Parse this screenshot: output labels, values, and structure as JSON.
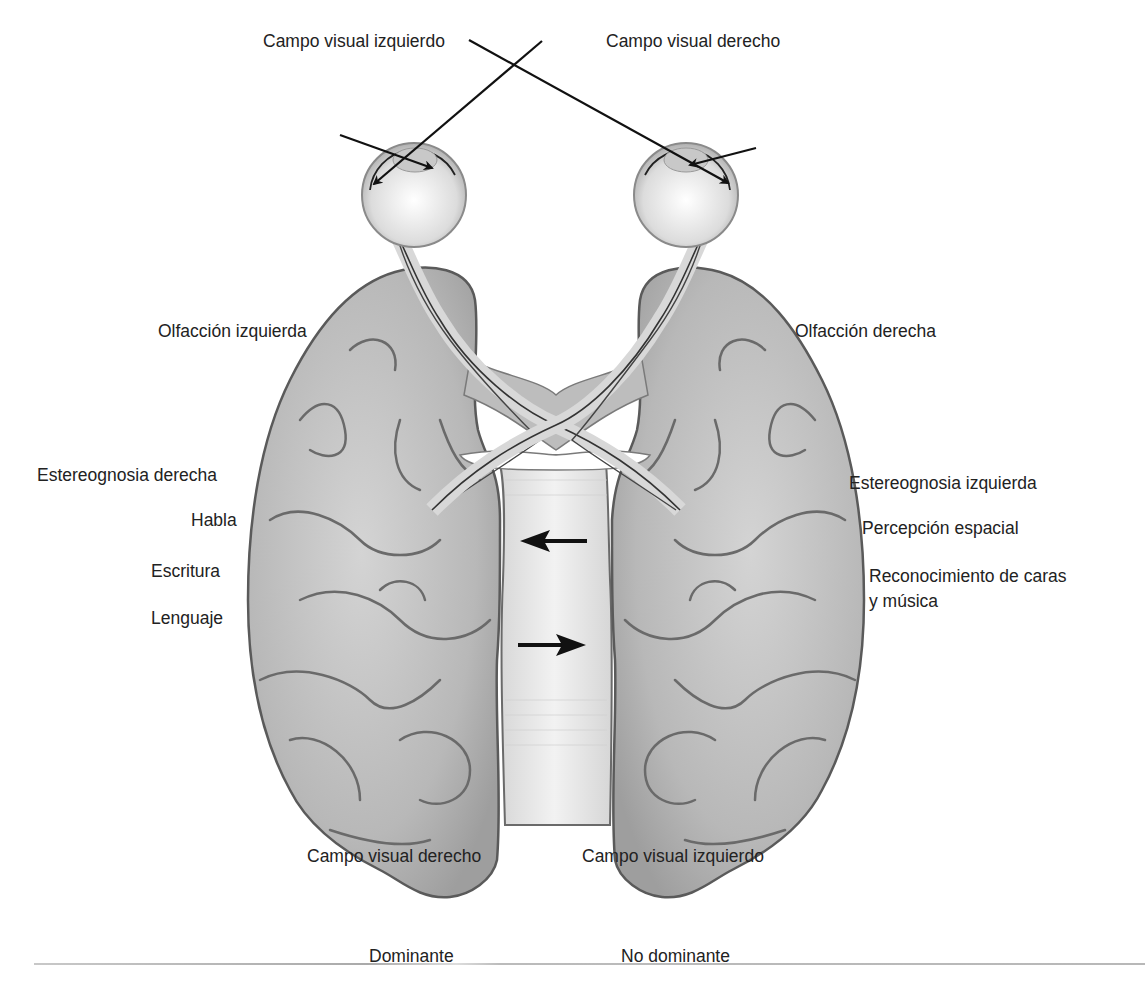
{
  "figure": {
    "colors": {
      "brain_fill": "#b9b9b9",
      "brain_outline": "#5a5a5a",
      "sulci": "#6a6a6a",
      "eye_fill": "#e6e6e6",
      "corpus_callosum": "#e4e4e4",
      "text": "#222222",
      "arrow": "#111111"
    }
  },
  "labels": {
    "top_left_field": "Campo visual izquierdo",
    "top_right_field": "Campo visual derecho",
    "left": {
      "olfaction": "Olfacción izquierda",
      "stereognosis": "Estereognosia derecha",
      "speech": "Habla",
      "writing": "Escritura",
      "language": "Lenguaje",
      "visual_field": "Campo visual derecho",
      "hemisphere": "Dominante"
    },
    "right": {
      "olfaction": "Olfacción derecha",
      "stereognosis": "Estereognosia izquierda",
      "spatial": "Percepción espacial",
      "recognition_line1": "Reconocimiento de caras",
      "recognition_line2": "y música",
      "visual_field": "Campo visual izquierdo",
      "hemisphere": "No dominante"
    }
  },
  "arrows": {
    "callosal_top": "left-arrow",
    "callosal_bottom": "right-arrow"
  }
}
